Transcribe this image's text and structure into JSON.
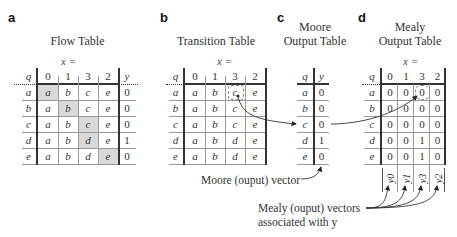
{
  "panels": {
    "a": {
      "letter": "a",
      "title": "Flow Table",
      "x_label": "x =",
      "q_header": "q",
      "y_header": "y",
      "columns": [
        "0",
        "1",
        "3",
        "2"
      ],
      "rows": [
        {
          "q": "a",
          "cells": [
            "a",
            "b",
            "c",
            "e"
          ],
          "y": "0",
          "shaded": 0
        },
        {
          "q": "b",
          "cells": [
            "a",
            "b",
            "c",
            "e"
          ],
          "y": "0",
          "shaded": 1
        },
        {
          "q": "c",
          "cells": [
            "a",
            "b",
            "c",
            "e"
          ],
          "y": "0",
          "shaded": 2
        },
        {
          "q": "d",
          "cells": [
            "a",
            "b",
            "d",
            "e"
          ],
          "y": "1",
          "shaded": 2
        },
        {
          "q": "e",
          "cells": [
            "a",
            "b",
            "d",
            "e"
          ],
          "y": "0",
          "shaded": 3
        }
      ]
    },
    "b": {
      "letter": "b",
      "title": "Transition Table",
      "x_label": "x =",
      "q_header": "q",
      "columns": [
        "0",
        "1",
        "3",
        "2"
      ],
      "rows": [
        {
          "q": "a",
          "cells": [
            "a",
            "b",
            "c",
            "e"
          ]
        },
        {
          "q": "b",
          "cells": [
            "a",
            "b",
            "c",
            "e"
          ]
        },
        {
          "q": "c",
          "cells": [
            "a",
            "b",
            "c",
            "e"
          ]
        },
        {
          "q": "d",
          "cells": [
            "a",
            "b",
            "d",
            "e"
          ]
        },
        {
          "q": "e",
          "cells": [
            "a",
            "b",
            "d",
            "e"
          ]
        }
      ]
    },
    "c": {
      "letter": "c",
      "title_line1": "Moore",
      "title_line2": "Output Table",
      "q_header": "q",
      "y_header": "y",
      "rows": [
        {
          "q": "a",
          "y": "0"
        },
        {
          "q": "b",
          "y": "0"
        },
        {
          "q": "c",
          "y": "0"
        },
        {
          "q": "d",
          "y": "1"
        },
        {
          "q": "e",
          "y": "0"
        }
      ]
    },
    "d": {
      "letter": "d",
      "title_line1": "Mealy",
      "title_line2": "Output Table",
      "x_label": "x =",
      "q_header": "q",
      "columns": [
        "0",
        "1",
        "3",
        "2"
      ],
      "rows": [
        {
          "q": "a",
          "cells": [
            "0",
            "0",
            "0",
            "0"
          ]
        },
        {
          "q": "b",
          "cells": [
            "0",
            "0",
            "0",
            "0"
          ]
        },
        {
          "q": "c",
          "cells": [
            "0",
            "0",
            "0",
            "0"
          ]
        },
        {
          "q": "d",
          "cells": [
            "0",
            "0",
            "1",
            "0"
          ]
        },
        {
          "q": "e",
          "cells": [
            "0",
            "0",
            "1",
            "0"
          ]
        }
      ],
      "vector_labels": [
        "y0",
        "y1",
        "y3",
        "y2"
      ]
    }
  },
  "annotations": {
    "moore_vector": "Moore (ouput) vector",
    "mealy_vectors_line1": "Mealy (ouput) vectors",
    "mealy_vectors_line2": "associated with y"
  }
}
